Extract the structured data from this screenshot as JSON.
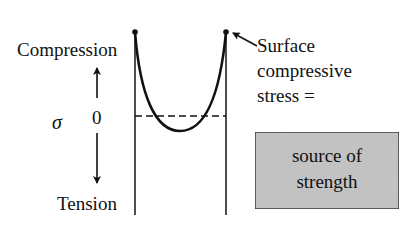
{
  "diagram": {
    "type": "residual-stress-profile",
    "axis": {
      "symbol": "σ",
      "zero_label": "0",
      "top_label": "Compression",
      "bottom_label": "Tension"
    },
    "annotation": {
      "lines": [
        "Surface",
        "compressive",
        "stress ="
      ]
    },
    "box": {
      "lines": [
        "source of",
        "strength"
      ],
      "fill_color": "#c6c6c6",
      "border_color": "#333333"
    },
    "colors": {
      "ink": "#111111",
      "background": "#ffffff"
    }
  }
}
